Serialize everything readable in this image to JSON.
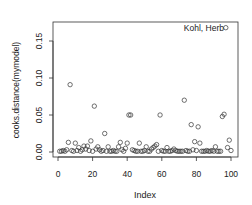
{
  "chart_data": {
    "type": "scatter",
    "title": "",
    "xlabel": "Index",
    "ylabel": "cooks.distance(mymodel)",
    "xlim": [
      0,
      100
    ],
    "ylim": [
      0,
      0.17
    ],
    "x_ticks": [
      "0",
      "20",
      "40",
      "60",
      "80",
      "100"
    ],
    "y_ticks": [
      "0.00",
      "0.05",
      "0.10",
      "0.15"
    ],
    "grid": false,
    "annotations": [
      {
        "text": "Kohl, Herb",
        "x": 97,
        "y": 0.168
      }
    ],
    "points": [
      [
        1,
        0.001
      ],
      [
        2,
        0.001
      ],
      [
        3,
        0.002
      ],
      [
        4,
        0.001
      ],
      [
        5,
        0.003
      ],
      [
        6,
        0.013
      ],
      [
        7,
        0.091
      ],
      [
        8,
        0.002
      ],
      [
        9,
        0.001
      ],
      [
        10,
        0.012
      ],
      [
        11,
        0.002
      ],
      [
        12,
        0.006
      ],
      [
        13,
        0.001
      ],
      [
        14,
        0.003
      ],
      [
        15,
        0.008
      ],
      [
        16,
        0.004
      ],
      [
        17,
        0.008
      ],
      [
        18,
        0.002
      ],
      [
        19,
        0.015
      ],
      [
        20,
        0.001
      ],
      [
        21,
        0.062
      ],
      [
        22,
        0.004
      ],
      [
        23,
        0.007
      ],
      [
        24,
        0.003
      ],
      [
        25,
        0.001
      ],
      [
        26,
        0.002
      ],
      [
        27,
        0.025
      ],
      [
        28,
        0.001
      ],
      [
        29,
        0.007
      ],
      [
        30,
        0.001
      ],
      [
        31,
        0.001
      ],
      [
        32,
        0.002
      ],
      [
        33,
        0.001
      ],
      [
        34,
        0.001
      ],
      [
        35,
        0.007
      ],
      [
        36,
        0.013
      ],
      [
        37,
        0.003
      ],
      [
        38,
        0.001
      ],
      [
        39,
        0.005
      ],
      [
        40,
        0.012
      ],
      [
        41,
        0.05
      ],
      [
        42,
        0.05
      ],
      [
        43,
        0.003
      ],
      [
        44,
        0.002
      ],
      [
        45,
        0.001
      ],
      [
        46,
        0.001
      ],
      [
        47,
        0.012
      ],
      [
        48,
        0.001
      ],
      [
        49,
        0.001
      ],
      [
        50,
        0.002
      ],
      [
        51,
        0.007
      ],
      [
        52,
        0.001
      ],
      [
        53,
        0.001
      ],
      [
        54,
        0.004
      ],
      [
        55,
        0.006
      ],
      [
        56,
        0.008
      ],
      [
        57,
        0.01
      ],
      [
        58,
        0.001
      ],
      [
        59,
        0.05
      ],
      [
        60,
        0.002
      ],
      [
        61,
        0.001
      ],
      [
        62,
        0.001
      ],
      [
        63,
        0.006
      ],
      [
        64,
        0.001
      ],
      [
        65,
        0.001
      ],
      [
        66,
        0.002
      ],
      [
        67,
        0.004
      ],
      [
        68,
        0.002
      ],
      [
        69,
        0.001
      ],
      [
        70,
        0.001
      ],
      [
        71,
        0.001
      ],
      [
        72,
        0.001
      ],
      [
        73,
        0.07
      ],
      [
        74,
        0.002
      ],
      [
        75,
        0.001
      ],
      [
        76,
        0.001
      ],
      [
        77,
        0.037
      ],
      [
        78,
        0.003
      ],
      [
        79,
        0.014
      ],
      [
        80,
        0.002
      ],
      [
        81,
        0.034
      ],
      [
        82,
        0.012
      ],
      [
        83,
        0.001
      ],
      [
        84,
        0.001
      ],
      [
        85,
        0.001
      ],
      [
        86,
        0.002
      ],
      [
        87,
        0.001
      ],
      [
        88,
        0.001
      ],
      [
        89,
        0.002
      ],
      [
        90,
        0.001
      ],
      [
        91,
        0.007
      ],
      [
        92,
        0.001
      ],
      [
        93,
        0.001
      ],
      [
        94,
        0.001
      ],
      [
        95,
        0.048
      ],
      [
        96,
        0.051
      ],
      [
        97,
        0.168
      ],
      [
        98,
        0.006
      ],
      [
        99,
        0.016
      ],
      [
        100,
        0.002
      ]
    ]
  }
}
